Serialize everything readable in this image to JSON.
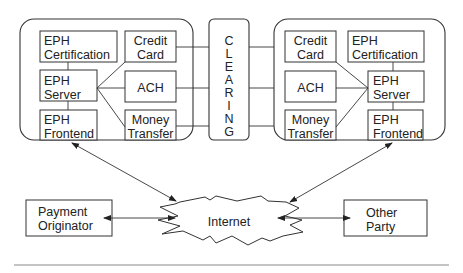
{
  "left_system": {
    "eph_certification": [
      "EPH",
      "Certification"
    ],
    "eph_server": [
      "EPH",
      "Server"
    ],
    "eph_frontend": [
      "EPH",
      "Frontend"
    ],
    "credit_card": [
      "Credit",
      "Card"
    ],
    "ach": "ACH",
    "money_transfer": [
      "Money",
      "Transfer"
    ]
  },
  "clearing": {
    "letters": [
      "C",
      "L",
      "E",
      "A",
      "R",
      "I",
      "N",
      "G"
    ]
  },
  "right_system": {
    "credit_card": [
      "Credit",
      "Card"
    ],
    "ach": "ACH",
    "money_transfer": [
      "Money",
      "Transfer"
    ],
    "eph_certification": [
      "EPH",
      "Certification"
    ],
    "eph_server": [
      "EPH",
      "Server"
    ],
    "eph_frontend": [
      "EPH",
      "Frontend"
    ]
  },
  "internet": "Internet",
  "payment_originator": [
    "Payment",
    "Originator"
  ],
  "other_party": [
    "Other",
    "Party"
  ],
  "colors": {
    "stroke": "#333333",
    "text": "#222222",
    "background": "#ffffff"
  }
}
